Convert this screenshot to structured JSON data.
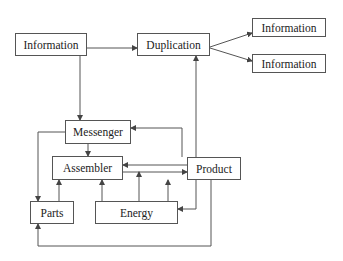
{
  "nodes": {
    "information_source": {
      "label": "Information"
    },
    "duplication": {
      "label": "Duplication"
    },
    "information_copy_1": {
      "label": "Information"
    },
    "information_copy_2": {
      "label": "Information"
    },
    "messenger": {
      "label": "Messenger"
    },
    "assembler": {
      "label": "Assembler"
    },
    "product": {
      "label": "Product"
    },
    "parts": {
      "label": "Parts"
    },
    "energy": {
      "label": "Energy"
    }
  },
  "edges": [
    {
      "from": "Information",
      "to": "Duplication"
    },
    {
      "from": "Information",
      "to": "Messenger"
    },
    {
      "from": "Duplication",
      "to": "Information (copy 1)"
    },
    {
      "from": "Duplication",
      "to": "Information (copy 2)"
    },
    {
      "from": "Product",
      "to": "Duplication"
    },
    {
      "from": "Product",
      "to": "Messenger"
    },
    {
      "from": "Messenger",
      "to": "Assembler"
    },
    {
      "from": "Messenger",
      "to": "Parts"
    },
    {
      "from": "Product",
      "to": "Assembler"
    },
    {
      "from": "Assembler",
      "to": "Product"
    },
    {
      "from": "Parts",
      "to": "Assembler"
    },
    {
      "from": "Energy",
      "to": "Assembler"
    },
    {
      "from": "Energy",
      "to": "Assembler-Product link"
    },
    {
      "from": "Energy",
      "to": "Product"
    },
    {
      "from": "Product",
      "to": "Energy"
    },
    {
      "from": "Product",
      "to": "Parts"
    }
  ],
  "colors": {
    "line": "#555555",
    "text": "#222222",
    "background": "#ffffff"
  }
}
